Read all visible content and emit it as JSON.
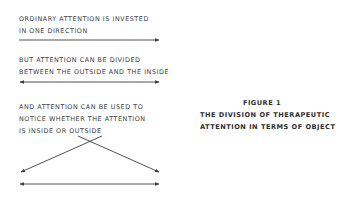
{
  "figure": {
    "label": "FIGURE 1",
    "title_line1": "THE DIVISION OF THERAPEUTIC",
    "title_line2": "ATTENTION IN TERMS OF OBJECT"
  },
  "panels": [
    {
      "line1": "ORDINARY ATTENTION IS INVESTED",
      "line2": "IN ONE DIRECTION",
      "arrow": "single-right"
    },
    {
      "line1": "BUT ATTENTION CAN BE DIVIDED",
      "line2": "BETWEEN THE OUTSIDE AND THE INSIDE",
      "arrow": "double-headed"
    },
    {
      "line1": "AND ATTENTION CAN BE USED TO",
      "line2": "NOTICE WHETHER THE ATTENTION",
      "line3": "IS INSIDE OR OUTSIDE",
      "arrow": "crossed-diagonals-plus-double-headed"
    }
  ],
  "colors": {
    "text": "#3a3a3a",
    "arrow": "#3c3c3c",
    "background": "#ffffff"
  }
}
